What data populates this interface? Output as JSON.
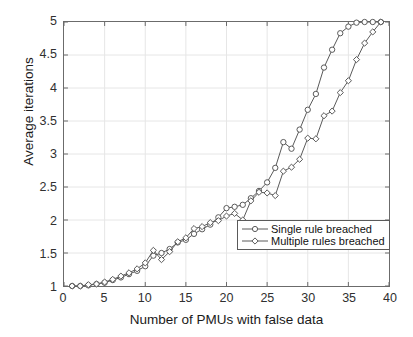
{
  "chart_data": {
    "type": "line",
    "title": "",
    "xlabel": "Number of PMUs with false data",
    "ylabel": "Average iterations",
    "xlim": [
      0,
      40
    ],
    "ylim": [
      1,
      5
    ],
    "xticks": [
      0,
      5,
      10,
      15,
      20,
      25,
      30,
      35,
      40
    ],
    "yticks": [
      1,
      1.5,
      2,
      2.5,
      3,
      3.5,
      4,
      4.5,
      5
    ],
    "grid": true,
    "legend_position": "inside-right-lower",
    "x": [
      1,
      2,
      3,
      4,
      5,
      6,
      7,
      8,
      9,
      10,
      11,
      12,
      13,
      14,
      15,
      16,
      17,
      18,
      19,
      20,
      21,
      22,
      23,
      24,
      25,
      26,
      27,
      28,
      29,
      30,
      31,
      32,
      33,
      34,
      35,
      36,
      37,
      38,
      39
    ],
    "series": [
      {
        "name": "Single rule breached",
        "marker": "circle",
        "color": "#5a5a5a",
        "values": [
          1.0,
          1.0,
          1.01,
          1.03,
          1.05,
          1.09,
          1.13,
          1.18,
          1.23,
          1.3,
          1.46,
          1.5,
          1.56,
          1.66,
          1.7,
          1.79,
          1.86,
          1.93,
          2.04,
          2.18,
          2.2,
          2.23,
          2.33,
          2.44,
          2.57,
          2.79,
          3.18,
          3.08,
          3.37,
          3.67,
          3.91,
          4.31,
          4.58,
          4.83,
          4.93,
          4.99,
          5.0,
          5.0,
          5.0
        ]
      },
      {
        "name": "Multiple rules breached",
        "marker": "diamond",
        "color": "#5a5a5a",
        "values": [
          1.0,
          1.0,
          1.02,
          1.03,
          1.06,
          1.1,
          1.15,
          1.2,
          1.26,
          1.35,
          1.54,
          1.4,
          1.52,
          1.67,
          1.73,
          1.87,
          1.9,
          1.96,
          1.99,
          2.06,
          2.1,
          2.0,
          2.29,
          2.42,
          2.41,
          2.37,
          2.74,
          2.8,
          2.92,
          3.24,
          3.23,
          3.58,
          3.65,
          3.93,
          4.11,
          4.43,
          4.68,
          4.85,
          5.0
        ]
      }
    ]
  },
  "legend": {
    "items": [
      {
        "label": "Single rule breached"
      },
      {
        "label": "Multiple rules breached"
      }
    ]
  },
  "axes": {
    "y_title": "Average iterations",
    "x_title": "Number of PMUs with false data"
  },
  "colors": {
    "line": "#5a5a5a",
    "grid": "#e6e6e6",
    "axis": "#6b6b6b",
    "text": "#1a1a1a",
    "background": "#ffffff"
  }
}
